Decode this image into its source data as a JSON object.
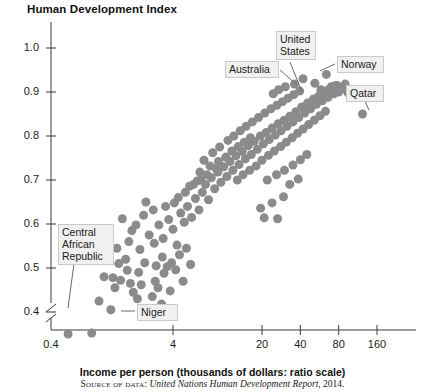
{
  "chart": {
    "title": "Human Development Index",
    "xlabel": "Income per person (thousands of dollars: ratio scale)",
    "source_label": "Source of data:",
    "source_report": "United Nations Human Development Report",
    "source_year": ", 2014."
  },
  "labels": {
    "australia": "Australia",
    "united_states": "United\nStates",
    "norway": "Norway",
    "qatar": "Qatar",
    "central_african_republic": "Central\nAfrican\nRepublic",
    "niger": "Niger"
  },
  "chart_data": {
    "type": "scatter",
    "title": "Human Development Index",
    "xlabel": "Income per person (thousands of dollars: ratio scale)",
    "ylabel": "Human Development Index",
    "xscale": "log",
    "yscale": "linear",
    "grid": false,
    "legend": null,
    "axis_break_y": true,
    "xticks": [
      0.4,
      4,
      20,
      40,
      80,
      160
    ],
    "xtick_labels": [
      "0.4",
      "4",
      "20",
      "40",
      "80",
      "160"
    ],
    "yticks": [
      0.4,
      0.5,
      0.6,
      0.7,
      0.8,
      0.9,
      1.0
    ],
    "ytick_labels": [
      "0.4",
      "0.5",
      "0.6",
      "0.7",
      "0.8",
      "0.9",
      "1.0"
    ],
    "ylim": [
      0.33,
      1.04
    ],
    "xlim": [
      0.4,
      220
    ],
    "marker_color": "#8b8b8b",
    "marker_size_px": 9,
    "annotations": [
      {
        "text": "Australia",
        "point": [
          42,
          0.93
        ]
      },
      {
        "text": "United States",
        "point": [
          52,
          0.92
        ]
      },
      {
        "text": "Norway",
        "point": [
          64,
          0.94
        ]
      },
      {
        "text": "Qatar",
        "point": [
          123,
          0.85
        ]
      },
      {
        "text": "Central African Republic",
        "point": [
          0.6,
          0.35
        ]
      },
      {
        "text": "Niger",
        "point": [
          0.9,
          0.35
        ]
      }
    ],
    "points": [
      [
        0.6,
        0.35
      ],
      [
        0.92,
        0.352
      ],
      [
        1.05,
        0.425
      ],
      [
        1.3,
        0.405
      ],
      [
        1.15,
        0.48
      ],
      [
        1.35,
        0.478
      ],
      [
        1.55,
        0.472
      ],
      [
        1.7,
        0.52
      ],
      [
        1.95,
        0.445
      ],
      [
        2.1,
        0.43
      ],
      [
        2.25,
        0.462
      ],
      [
        2.4,
        0.512
      ],
      [
        2.55,
        0.398
      ],
      [
        2.75,
        0.435
      ],
      [
        2.9,
        0.47
      ],
      [
        3.05,
        0.455
      ],
      [
        3.25,
        0.418
      ],
      [
        3.4,
        0.488
      ],
      [
        3.6,
        0.503
      ],
      [
        3.8,
        0.448
      ],
      [
        1.45,
        0.545
      ],
      [
        1.8,
        0.56
      ],
      [
        2.2,
        0.542
      ],
      [
        2.6,
        0.575
      ],
      [
        2.85,
        0.556
      ],
      [
        3.1,
        0.598
      ],
      [
        3.35,
        0.567
      ],
      [
        3.7,
        0.61
      ],
      [
        4.0,
        0.588
      ],
      [
        4.3,
        0.552
      ],
      [
        4.6,
        0.625
      ],
      [
        4.9,
        0.604
      ],
      [
        5.2,
        0.64
      ],
      [
        5.6,
        0.615
      ],
      [
        6.0,
        0.658
      ],
      [
        6.4,
        0.632
      ],
      [
        3.9,
        0.512
      ],
      [
        4.2,
        0.496
      ],
      [
        4.5,
        0.53
      ],
      [
        4.8,
        0.47
      ],
      [
        5.1,
        0.545
      ],
      [
        5.5,
        0.508
      ],
      [
        2.05,
        0.598
      ],
      [
        2.35,
        0.62
      ],
      [
        1.6,
        0.612
      ],
      [
        1.9,
        0.585
      ],
      [
        6.8,
        0.672
      ],
      [
        7.2,
        0.69
      ],
      [
        7.6,
        0.655
      ],
      [
        8.0,
        0.705
      ],
      [
        8.5,
        0.68
      ],
      [
        9.0,
        0.718
      ],
      [
        9.5,
        0.695
      ],
      [
        10.0,
        0.73
      ],
      [
        10.6,
        0.708
      ],
      [
        11.2,
        0.742
      ],
      [
        11.8,
        0.722
      ],
      [
        12.5,
        0.755
      ],
      [
        13.2,
        0.735
      ],
      [
        14.0,
        0.765
      ],
      [
        14.8,
        0.748
      ],
      [
        15.6,
        0.778
      ],
      [
        16.5,
        0.758
      ],
      [
        17.4,
        0.788
      ],
      [
        18.4,
        0.77
      ],
      [
        19.4,
        0.8
      ],
      [
        20.5,
        0.782
      ],
      [
        21.6,
        0.808
      ],
      [
        22.8,
        0.792
      ],
      [
        24.0,
        0.818
      ],
      [
        25.4,
        0.802
      ],
      [
        26.8,
        0.828
      ],
      [
        28.2,
        0.812
      ],
      [
        29.8,
        0.836
      ],
      [
        31.4,
        0.822
      ],
      [
        33.1,
        0.845
      ],
      [
        35.0,
        0.832
      ],
      [
        36.9,
        0.855
      ],
      [
        38.9,
        0.842
      ],
      [
        41.0,
        0.866
      ],
      [
        43.3,
        0.852
      ],
      [
        45.6,
        0.875
      ],
      [
        48.1,
        0.862
      ],
      [
        50.7,
        0.884
      ],
      [
        53.5,
        0.872
      ],
      [
        56.4,
        0.892
      ],
      [
        59.5,
        0.88
      ],
      [
        62.7,
        0.9
      ],
      [
        66.1,
        0.888
      ],
      [
        69.7,
        0.908
      ],
      [
        73.5,
        0.896
      ],
      [
        77.5,
        0.915
      ],
      [
        7.0,
        0.745
      ],
      [
        8.2,
        0.762
      ],
      [
        9.3,
        0.775
      ],
      [
        10.8,
        0.79
      ],
      [
        12.0,
        0.8
      ],
      [
        13.5,
        0.812
      ],
      [
        15.0,
        0.822
      ],
      [
        16.8,
        0.832
      ],
      [
        18.8,
        0.842
      ],
      [
        21.0,
        0.852
      ],
      [
        23.5,
        0.862
      ],
      [
        26.2,
        0.87
      ],
      [
        29.0,
        0.878
      ],
      [
        32.0,
        0.886
      ],
      [
        35.5,
        0.894
      ],
      [
        39.5,
        0.902
      ],
      [
        6.5,
        0.718
      ],
      [
        7.8,
        0.732
      ],
      [
        9.1,
        0.742
      ],
      [
        10.4,
        0.752
      ],
      [
        11.6,
        0.766
      ],
      [
        13.0,
        0.776
      ],
      [
        14.5,
        0.786
      ],
      [
        16.2,
        0.796
      ],
      [
        5.8,
        0.69
      ],
      [
        6.6,
        0.7
      ],
      [
        7.4,
        0.712
      ],
      [
        8.7,
        0.726
      ],
      [
        12.8,
        0.7
      ],
      [
        14.2,
        0.712
      ],
      [
        16.0,
        0.722
      ],
      [
        18.0,
        0.732
      ],
      [
        20.0,
        0.745
      ],
      [
        22.5,
        0.756
      ],
      [
        25.0,
        0.766
      ],
      [
        28.0,
        0.776
      ],
      [
        31.0,
        0.786
      ],
      [
        34.5,
        0.796
      ],
      [
        38.0,
        0.806
      ],
      [
        42.0,
        0.816
      ],
      [
        46.5,
        0.826
      ],
      [
        51.5,
        0.836
      ],
      [
        57.0,
        0.846
      ],
      [
        63.0,
        0.856
      ],
      [
        22.0,
        0.7
      ],
      [
        26.0,
        0.712
      ],
      [
        30.0,
        0.722
      ],
      [
        35.0,
        0.734
      ],
      [
        40.0,
        0.746
      ],
      [
        45.0,
        0.758
      ],
      [
        33.0,
        0.69
      ],
      [
        38.5,
        0.702
      ],
      [
        44.0,
        0.868
      ],
      [
        49.0,
        0.876
      ],
      [
        54.0,
        0.886
      ],
      [
        60.0,
        0.896
      ],
      [
        67.0,
        0.906
      ],
      [
        75.0,
        0.914
      ],
      [
        85.0,
        0.906
      ],
      [
        95.0,
        0.898
      ],
      [
        42.0,
        0.93
      ],
      [
        52.0,
        0.92
      ],
      [
        64.0,
        0.94
      ],
      [
        123.0,
        0.85
      ],
      [
        36.0,
        0.918
      ],
      [
        30.5,
        0.912
      ],
      [
        27.0,
        0.905
      ],
      [
        24.5,
        0.896
      ],
      [
        19.5,
        0.636
      ],
      [
        24.0,
        0.648
      ],
      [
        29.5,
        0.662
      ],
      [
        20.8,
        0.614
      ],
      [
        4.4,
        0.66
      ],
      [
        5.0,
        0.672
      ],
      [
        5.4,
        0.686
      ],
      [
        6.2,
        0.698
      ],
      [
        3.5,
        0.64
      ],
      [
        4.1,
        0.648
      ],
      [
        2.8,
        0.632
      ],
      [
        2.45,
        0.65
      ],
      [
        1.75,
        0.495
      ],
      [
        2.15,
        0.49
      ],
      [
        2.95,
        0.505
      ],
      [
        3.3,
        0.525
      ],
      [
        1.25,
        0.52
      ],
      [
        1.5,
        0.51
      ],
      [
        1.4,
        0.455
      ],
      [
        1.85,
        0.465
      ],
      [
        58.0,
        0.905
      ],
      [
        70.0,
        0.912
      ],
      [
        80.0,
        0.9
      ],
      [
        90.0,
        0.918
      ],
      [
        26.5,
        0.612
      ]
    ]
  }
}
